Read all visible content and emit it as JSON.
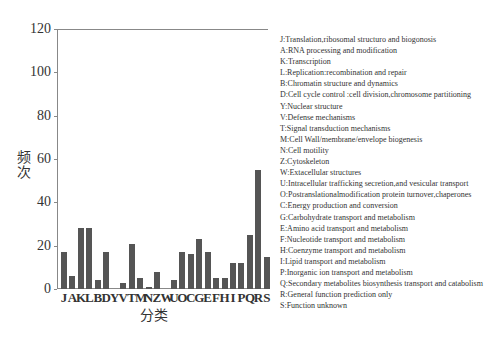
{
  "chart_data": {
    "type": "bar",
    "title": "",
    "xlabel": "分类",
    "ylabel": "频次",
    "ylim": [
      0,
      120
    ],
    "yticks": [
      0,
      20,
      40,
      60,
      80,
      100,
      120
    ],
    "grid": false,
    "legend_position": "right",
    "categories": [
      "J",
      "A",
      "K",
      "L",
      "B",
      "D",
      "Y",
      "V",
      "T",
      "M",
      "N",
      "Z",
      "W",
      "U",
      "O",
      "C",
      "G",
      "E",
      "F",
      "H",
      "I",
      "P",
      "Q",
      "R",
      "S"
    ],
    "values": [
      17,
      6,
      28,
      28,
      4,
      17,
      0,
      3,
      21,
      5,
      1,
      8,
      0,
      4,
      17,
      16,
      23,
      17,
      5,
      5,
      12,
      12,
      25,
      55,
      15
    ],
    "bar_color": "#555555",
    "legend": [
      "J:Translation,ribosomal structuro and biogonosis",
      "A:RNA processing and modification",
      "K:Transcription",
      "L:Replication:recombination and repair",
      "B:Chromatin structure and dynamics",
      "D:Cell cycle control :cell division,chromosome partitioning",
      "Y:Nuclear structure",
      "V:Defense mechanisms",
      "T:Signal transduction mechanisms",
      "M:Cell Wall/membrane/envelope biogenesis",
      "N:Cell motility",
      "Z:Cytoskeleton",
      "W:Extacellular structures",
      "U:Intracellular trafficking secretion,and vesicular transport",
      "O:Postranslationalmodification protein turnover,chaperones",
      "C:Energy production and conversion",
      "G:Carbohydrate transport and metabolism",
      "E:Amino acid transport and metabolism",
      "F:Nucleotide transport and metabolism",
      "H:Coenzyme transport and metabolism",
      "I:Lipid transport and metabolism",
      "P:Inorganic ion transport and metabolism",
      "Q:Secondary metabolites biosynthesis transport and catabolism",
      "R:General function prediction only",
      "S:Function unknown"
    ]
  }
}
